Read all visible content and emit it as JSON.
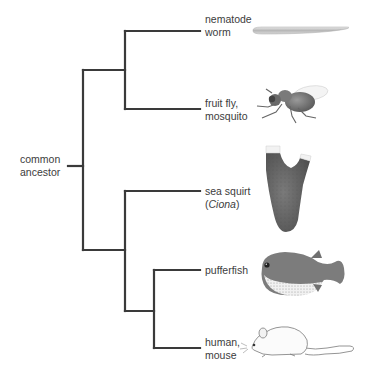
{
  "diagram": {
    "type": "phylogenetic-tree",
    "root_label": [
      "common",
      "ancestor"
    ],
    "line_color": "#3a3a3a",
    "leaves": [
      {
        "id": "nematode",
        "label_lines": [
          "nematode",
          "worm"
        ],
        "image": "nematode-worm"
      },
      {
        "id": "fruitfly",
        "label_lines": [
          "fruit fly,",
          "mosquito"
        ],
        "image": "fruit-fly"
      },
      {
        "id": "seasquirt",
        "label_lines": [
          "sea squirt",
          "(Ciona)"
        ],
        "italic_word": "Ciona",
        "image": "sea-squirt"
      },
      {
        "id": "pufferfish",
        "label_lines": [
          "pufferfish"
        ],
        "image": "pufferfish"
      },
      {
        "id": "humanmouse",
        "label_lines": [
          "human,",
          "mouse"
        ],
        "image": "mouse"
      }
    ],
    "topology": "((nematode, fruitfly), (seasquirt, (pufferfish, humanmouse)))"
  },
  "labels": {
    "ancestor_1": "common",
    "ancestor_2": "ancestor",
    "nematode_1": "nematode",
    "nematode_2": "worm",
    "fly_1": "fruit fly,",
    "fly_2": "mosquito",
    "squirt_1": "sea squirt",
    "squirt_2_open": "(",
    "squirt_2_italic": "Ciona",
    "squirt_2_close": ")",
    "puffer_1": "pufferfish",
    "human_1": "human,",
    "human_2": "mouse"
  }
}
